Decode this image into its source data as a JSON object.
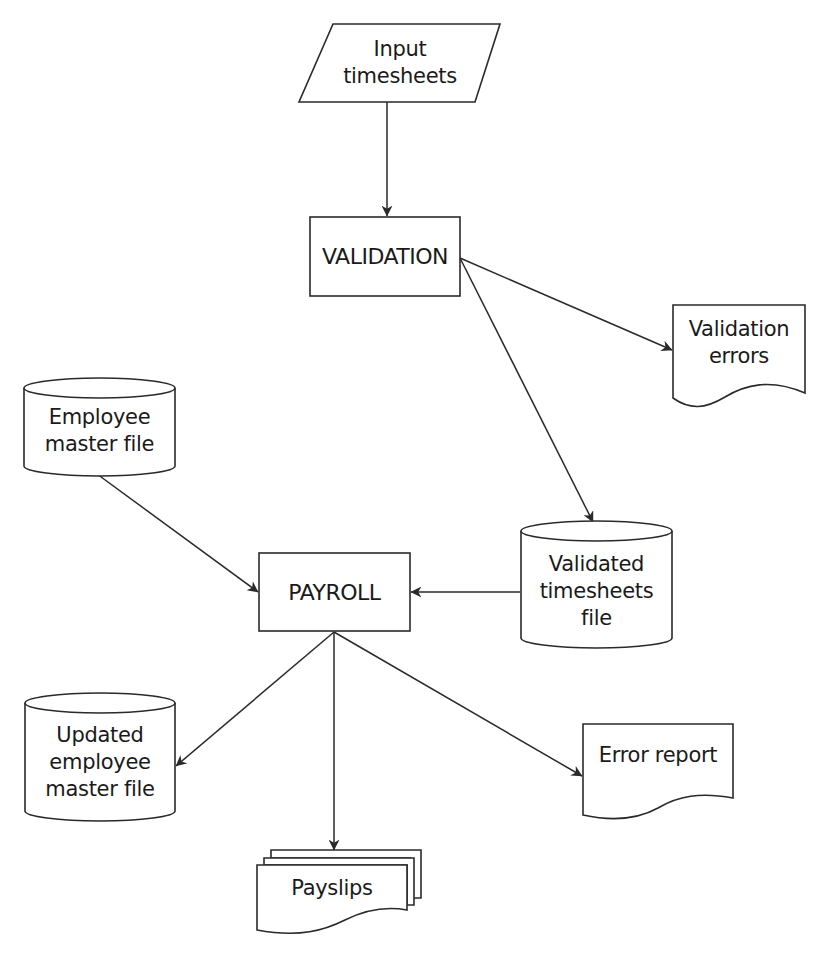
{
  "diagram": {
    "type": "system-flowchart",
    "nodes": [
      {
        "id": "input_timesheets",
        "shape": "parallelogram",
        "lines": [
          "Input",
          "timesheets"
        ]
      },
      {
        "id": "validation",
        "shape": "process",
        "lines": [
          "VALIDATION"
        ]
      },
      {
        "id": "validation_errors",
        "shape": "document",
        "lines": [
          "Validation",
          "errors"
        ]
      },
      {
        "id": "employee_master_file",
        "shape": "cylinder",
        "lines": [
          "Employee",
          "master file"
        ]
      },
      {
        "id": "validated_timesheets_file",
        "shape": "cylinder",
        "lines": [
          "Validated",
          "timesheets",
          "file"
        ]
      },
      {
        "id": "payroll",
        "shape": "process",
        "lines": [
          "PAYROLL"
        ]
      },
      {
        "id": "updated_employee_master_file",
        "shape": "cylinder",
        "lines": [
          "Updated",
          "employee",
          "master file"
        ]
      },
      {
        "id": "error_report",
        "shape": "document",
        "lines": [
          "Error report"
        ]
      },
      {
        "id": "payslips",
        "shape": "multi-document",
        "lines": [
          "Payslips"
        ]
      }
    ],
    "edges": [
      {
        "from": "input_timesheets",
        "to": "validation"
      },
      {
        "from": "validation",
        "to": "validation_errors"
      },
      {
        "from": "validation",
        "to": "validated_timesheets_file"
      },
      {
        "from": "employee_master_file",
        "to": "payroll"
      },
      {
        "from": "validated_timesheets_file",
        "to": "payroll"
      },
      {
        "from": "payroll",
        "to": "updated_employee_master_file"
      },
      {
        "from": "payroll",
        "to": "payslips"
      },
      {
        "from": "payroll",
        "to": "error_report"
      }
    ],
    "colors": {
      "stroke": "#2a2a2a",
      "fill": "#ffffff",
      "text": "#1a1a1a"
    }
  }
}
